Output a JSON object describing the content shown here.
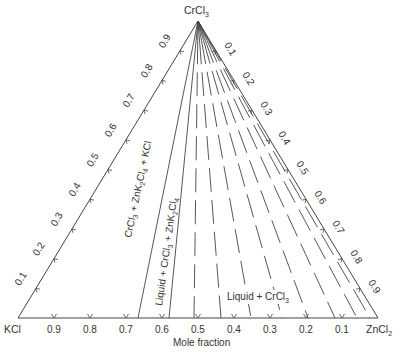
{
  "diagram": {
    "type": "ternary-phase-diagram",
    "colors": {
      "line": "#444444",
      "text": "#333333",
      "background": "#ffffff"
    },
    "vertices": {
      "top": {
        "label": "CrCl",
        "sub": "3"
      },
      "left": {
        "label": "KCl"
      },
      "right": {
        "label": "ZnCl",
        "sub": "2"
      }
    },
    "axis_title": "Mole fraction",
    "bottom_ticks": [
      "0.9",
      "0.8",
      "0.7",
      "0.6",
      "0.5",
      "0.4",
      "0.3",
      "0.2",
      "0.1"
    ],
    "left_ticks": [
      "0.1",
      "0.2",
      "0.3",
      "0.4",
      "0.5",
      "0.6",
      "0.7",
      "0.8",
      "0.9"
    ],
    "right_ticks": [
      "0.1",
      "0.2",
      "0.3",
      "0.4",
      "0.5",
      "0.6",
      "0.7",
      "0.8",
      "0.9"
    ],
    "regions": {
      "r1": {
        "pre": "CrCl",
        "s1": "3",
        "mid": " + ZnK",
        "s2": "2",
        "mid2": "Cl",
        "s3": "4",
        "post": " + KCl"
      },
      "r2": {
        "pre": "Liquid + CrCl",
        "s1": "3",
        "mid": " + ZnK",
        "s2": "2",
        "mid2": "Cl",
        "s3": "4"
      },
      "r3": {
        "pre": "Liquid + CrCl",
        "s1": "3"
      }
    },
    "tie_lines": {
      "solid_bottom_x": [
        138,
        169
      ],
      "dashed_bottom_x": [
        194,
        221,
        251,
        282,
        308,
        335,
        357,
        370
      ]
    }
  }
}
